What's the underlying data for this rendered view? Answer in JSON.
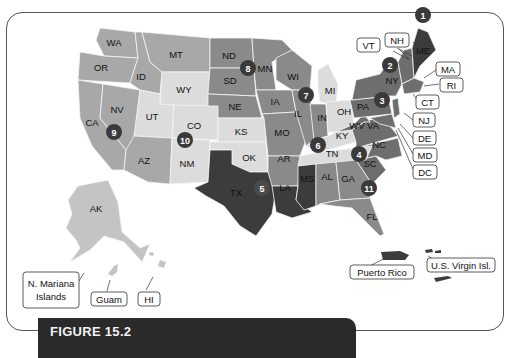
{
  "map": {
    "type": "us-states-choropleth",
    "colors": {
      "darkest": "#3c3c3c",
      "dark": "#6e6e6e",
      "medium_dark": "#8a8a8a",
      "medium": "#a8a8a8",
      "light": "#c4c4c4",
      "lightest": "#dcdcdc",
      "marker": "#3a3a3a"
    },
    "states": {
      "WA": "WA",
      "OR": "OR",
      "CA": "CA",
      "NV": "NV",
      "ID": "ID",
      "MT": "MT",
      "WY": "WY",
      "UT": "UT",
      "AZ": "AZ",
      "CO": "CO",
      "NM": "NM",
      "ND": "ND",
      "SD": "SD",
      "NE": "NE",
      "KS": "KS",
      "OK": "OK",
      "TX": "TX",
      "MN": "MN",
      "IA": "IA",
      "MO": "MO",
      "AR": "AR",
      "LA": "LA",
      "WI": "WI",
      "IL": "IL",
      "MI": "MI",
      "IN": "IN",
      "OH": "OH",
      "KY": "KY",
      "TN": "TN",
      "MS": "MS",
      "AL": "AL",
      "GA": "GA",
      "FL": "FL",
      "SC": "SC",
      "NC": "NC",
      "VA": "VA",
      "WV": "WV",
      "PA": "PA",
      "NY": "NY",
      "ME": "ME",
      "AK": "AK"
    },
    "callouts": {
      "VT": "VT",
      "NH": "NH",
      "MA": "MA",
      "RI": "RI",
      "CT": "CT",
      "NJ": "NJ",
      "DE": "DE",
      "MD": "MD",
      "DC": "DC",
      "HI": "HI",
      "Guam": "Guam",
      "NMI_line1": "N. Mariana",
      "NMI_line2": "Islands",
      "PR": "Puerto Rico",
      "USVI": "U.S. Virgin Isl."
    },
    "markers": [
      {
        "n": "1",
        "region": "ME"
      },
      {
        "n": "2",
        "region": "NY"
      },
      {
        "n": "3",
        "region": "PA"
      },
      {
        "n": "4",
        "region": "SC"
      },
      {
        "n": "5",
        "region": "TX"
      },
      {
        "n": "6",
        "region": "TN"
      },
      {
        "n": "7",
        "region": "IL"
      },
      {
        "n": "8",
        "region": "ND/MN"
      },
      {
        "n": "9",
        "region": "CA/NV"
      },
      {
        "n": "10",
        "region": "CO"
      },
      {
        "n": "11",
        "region": "GA"
      }
    ]
  },
  "caption": {
    "figure_label": "FIGURE 15.2",
    "subtitle": ""
  }
}
